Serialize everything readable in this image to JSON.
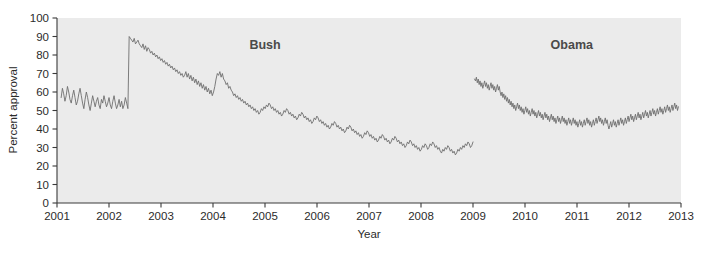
{
  "chart_data": {
    "type": "line",
    "title": "",
    "xlabel": "Year",
    "ylabel": "Percent approval",
    "xlim": [
      2001,
      2013
    ],
    "ylim": [
      0,
      100
    ],
    "grid": false,
    "legend_position": "inline-annotations",
    "background_color": "#ebebeb",
    "line_color": "#6e6e6e",
    "axis_color": "#3a3a3a",
    "xticks": [
      "2001",
      "2002",
      "2003",
      "2004",
      "2005",
      "2006",
      "2007",
      "2008",
      "2009",
      "2010",
      "2011",
      "2012",
      "2013"
    ],
    "yticks": [
      "0",
      "10",
      "20",
      "30",
      "40",
      "50",
      "60",
      "70",
      "80",
      "90",
      "100"
    ],
    "annotations": [
      {
        "label": "Bush",
        "x": 2005.0,
        "y": 83
      },
      {
        "label": "Obama",
        "x": 2010.9,
        "y": 83
      }
    ],
    "series": [
      {
        "name": "Bush",
        "color": "#6e6e6e",
        "x_start": 2001.08,
        "x_end": 2009.0,
        "values": [
          57,
          62,
          59,
          55,
          58,
          63,
          60,
          56,
          54,
          58,
          61,
          57,
          53,
          55,
          59,
          62,
          58,
          54,
          51,
          56,
          60,
          57,
          53,
          50,
          54,
          58,
          55,
          52,
          55,
          57,
          53,
          51,
          56,
          54,
          58,
          55,
          52,
          54,
          57,
          53,
          51,
          55,
          58,
          54,
          51,
          53,
          56,
          52,
          55,
          51,
          53,
          57,
          54,
          51,
          90,
          89,
          88,
          87,
          89,
          86,
          87,
          88,
          86,
          85,
          84,
          86,
          83,
          85,
          82,
          84,
          83,
          81,
          82,
          80,
          81,
          79,
          80,
          78,
          79,
          77,
          78,
          76,
          77,
          75,
          76,
          74,
          75,
          73,
          74,
          72,
          73,
          71,
          72,
          70,
          71,
          69,
          70,
          68,
          69,
          71,
          68,
          70,
          67,
          69,
          66,
          68,
          65,
          67,
          64,
          66,
          63,
          65,
          62,
          64,
          61,
          63,
          60,
          62,
          59,
          61,
          58,
          60,
          63,
          67,
          70,
          69,
          71,
          68,
          70,
          67,
          66,
          64,
          65,
          62,
          63,
          61,
          60,
          58,
          59,
          57,
          58,
          56,
          57,
          55,
          56,
          54,
          55,
          53,
          54,
          52,
          53,
          51,
          52,
          50,
          51,
          49,
          50,
          48,
          49,
          51,
          50,
          52,
          51,
          53,
          52,
          54,
          53,
          51,
          52,
          50,
          51,
          49,
          50,
          48,
          49,
          47,
          48,
          50,
          49,
          51,
          50,
          48,
          49,
          47,
          48,
          46,
          47,
          45,
          46,
          48,
          47,
          49,
          48,
          46,
          47,
          45,
          46,
          44,
          45,
          43,
          44,
          46,
          45,
          47,
          46,
          44,
          45,
          43,
          44,
          42,
          43,
          41,
          42,
          40,
          41,
          43,
          42,
          44,
          43,
          41,
          42,
          40,
          41,
          39,
          40,
          38,
          39,
          41,
          40,
          42,
          41,
          39,
          40,
          38,
          39,
          37,
          38,
          36,
          37,
          35,
          36,
          38,
          37,
          39,
          38,
          36,
          37,
          35,
          36,
          34,
          35,
          33,
          34,
          36,
          35,
          37,
          36,
          34,
          35,
          33,
          34,
          32,
          33,
          35,
          34,
          36,
          35,
          33,
          34,
          32,
          33,
          31,
          32,
          30,
          31,
          33,
          32,
          34,
          33,
          31,
          32,
          30,
          31,
          29,
          30,
          28,
          29,
          31,
          30,
          32,
          31,
          29,
          30,
          32,
          31,
          33,
          32,
          30,
          31,
          29,
          30,
          28,
          27,
          29,
          28,
          30,
          29,
          31,
          30,
          28,
          29,
          27,
          28,
          26,
          27,
          29,
          28,
          30,
          29,
          31,
          30,
          32,
          31,
          33,
          32,
          30,
          31,
          33
        ]
      },
      {
        "name": "Obama",
        "color": "#6e6e6e",
        "x_start": 2009.03,
        "x_end": 2012.95,
        "values": [
          67,
          66,
          68,
          65,
          67,
          64,
          66,
          63,
          65,
          62,
          64,
          66,
          63,
          65,
          62,
          64,
          61,
          63,
          65,
          62,
          64,
          61,
          63,
          60,
          62,
          64,
          61,
          63,
          60,
          58,
          60,
          57,
          59,
          56,
          58,
          55,
          57,
          54,
          56,
          53,
          55,
          52,
          54,
          51,
          53,
          50,
          52,
          54,
          51,
          53,
          50,
          52,
          49,
          51,
          48,
          50,
          52,
          49,
          51,
          48,
          50,
          47,
          49,
          51,
          48,
          50,
          47,
          49,
          46,
          48,
          50,
          47,
          49,
          46,
          48,
          45,
          47,
          49,
          46,
          48,
          45,
          47,
          44,
          46,
          48,
          45,
          47,
          44,
          46,
          43,
          45,
          47,
          44,
          46,
          43,
          45,
          47,
          44,
          46,
          43,
          45,
          42,
          44,
          46,
          43,
          45,
          42,
          44,
          46,
          43,
          45,
          42,
          44,
          41,
          43,
          45,
          42,
          44,
          41,
          43,
          45,
          42,
          44,
          46,
          43,
          45,
          42,
          44,
          41,
          43,
          45,
          42,
          44,
          46,
          43,
          45,
          47,
          44,
          46,
          43,
          45,
          42,
          44,
          46,
          43,
          45,
          42,
          40,
          42,
          44,
          41,
          43,
          45,
          42,
          44,
          41,
          43,
          45,
          42,
          44,
          46,
          43,
          45,
          42,
          44,
          46,
          43,
          45,
          47,
          44,
          46,
          48,
          45,
          47,
          44,
          46,
          48,
          45,
          47,
          49,
          46,
          48,
          45,
          47,
          49,
          46,
          48,
          50,
          47,
          49,
          46,
          48,
          50,
          47,
          49,
          51,
          48,
          50,
          47,
          49,
          51,
          48,
          50,
          52,
          49,
          51,
          48,
          50,
          52,
          49,
          51,
          53,
          50,
          52,
          49,
          51,
          53,
          50,
          52,
          54,
          51,
          53,
          50,
          52
        ]
      }
    ]
  },
  "axes": {
    "x_title": "Year",
    "y_title": "Percent approval"
  }
}
